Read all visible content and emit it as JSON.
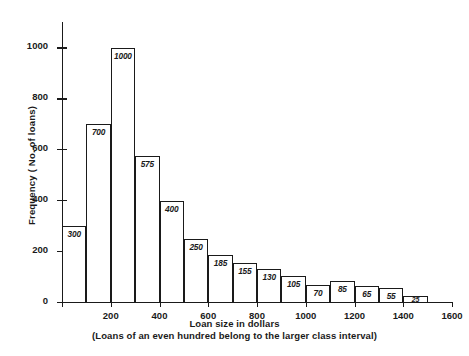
{
  "chart_data": {
    "type": "bar",
    "title": "",
    "xlabel": "Loan size in dollars",
    "xsublabel": "(Loans of an even hundred belong to the larger class interval)",
    "ylabel": "Frequency ( No. of loans)",
    "categories": [
      "0-100",
      "100-200",
      "200-300",
      "300-400",
      "400-500",
      "500-600",
      "600-700",
      "700-800",
      "800-900",
      "900-1000",
      "1000-1100",
      "1100-1200",
      "1200-1300",
      "1300-1400",
      "1400-1500"
    ],
    "bin_edges": [
      0,
      100,
      200,
      300,
      400,
      500,
      600,
      700,
      800,
      900,
      1000,
      1100,
      1200,
      1300,
      1400,
      1500
    ],
    "values": [
      300,
      700,
      1000,
      575,
      400,
      250,
      185,
      155,
      130,
      105,
      70,
      85,
      65,
      55,
      25
    ],
    "bar_labels": [
      "300",
      "700",
      "1000",
      "575",
      "400",
      "250",
      "185",
      "155",
      "130",
      "105",
      "70",
      "85",
      "65",
      "55",
      "25"
    ],
    "xlim": [
      0,
      1600
    ],
    "ylim": [
      0,
      1100
    ],
    "xticks": [
      0,
      200,
      400,
      600,
      800,
      1000,
      1200,
      1400,
      1600
    ],
    "xtick_labels": [
      "",
      "200",
      "400",
      "600",
      "800",
      "1000",
      "1200",
      "1400",
      "1600"
    ],
    "yticks": [
      0,
      200,
      400,
      600,
      800,
      1000
    ],
    "ytick_labels": [
      "0",
      "200",
      "400",
      "600",
      "800",
      "1000"
    ],
    "grid": false,
    "legend": "none",
    "bar_fill": "#ffffff",
    "bar_stroke": "#1a1a1a",
    "axis_color": "#1a1a1a",
    "background": "#ffffff"
  }
}
